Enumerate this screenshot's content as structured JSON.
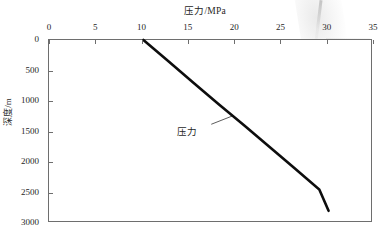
{
  "chart_data": {
    "type": "line",
    "title": "压力/MPa",
    "xlabel": "压力/MPa",
    "ylabel": "深度/m",
    "xlim": [
      0,
      35
    ],
    "ylim": [
      0,
      3000
    ],
    "y_inverted": true,
    "x_axis_position": "top",
    "grid": false,
    "legend_position": "none",
    "xticks": [
      {
        "value": 0,
        "label": "0"
      },
      {
        "value": 5,
        "label": "5"
      },
      {
        "value": 10,
        "label": "10"
      },
      {
        "value": 15,
        "label": "15"
      },
      {
        "value": 20,
        "label": "20"
      },
      {
        "value": 25,
        "label": "25"
      },
      {
        "value": 30,
        "label": "30"
      },
      {
        "value": 35,
        "label": "35"
      }
    ],
    "yticks": [
      {
        "value": 0,
        "label": "0"
      },
      {
        "value": 500,
        "label": "500"
      },
      {
        "value": 1000,
        "label": "1000"
      },
      {
        "value": 1500,
        "label": "1500"
      },
      {
        "value": 2000,
        "label": "2000"
      },
      {
        "value": 2500,
        "label": "2500"
      },
      {
        "value": 3000,
        "label": "3000"
      }
    ],
    "series": [
      {
        "name": "压力",
        "color": "#0d0d0d",
        "x": [
          10.2,
          12.9,
          15.6,
          18.3,
          21.1,
          23.8,
          26.5,
          29.2,
          30.2
        ],
        "y": [
          0,
          350,
          700,
          1050,
          1400,
          1750,
          2100,
          2450,
          2800
        ]
      }
    ],
    "annotations": [
      {
        "text": "压力",
        "x": 15.8,
        "y": 1480,
        "pointer_x": 19.9,
        "pointer_y": 1240
      }
    ]
  }
}
